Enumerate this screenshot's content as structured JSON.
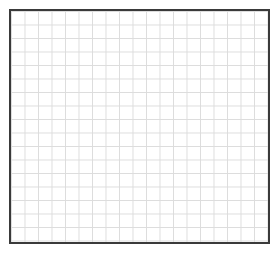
{
  "canvas": {
    "width": 280,
    "height": 254,
    "background_color": "#ffffff"
  },
  "grid_panel": {
    "name": "empty-grid-plot-area",
    "frame": {
      "left": 11,
      "top": 11,
      "width": 257,
      "height": 231,
      "border_color": "#3a3a3a",
      "border_width": 2,
      "fill_color": "#ffffff"
    },
    "gridlines": {
      "color": "#dcdcdc",
      "line_width": 1,
      "cell_width": 13.5,
      "cell_height": 13.5,
      "columns": 19,
      "rows": 17,
      "style": "uniform",
      "major_minor": false
    }
  },
  "chart_data": {
    "type": "scatter",
    "title": "",
    "subtitle": "",
    "xlabel": "",
    "ylabel": "",
    "categories": [],
    "series": [],
    "x": [],
    "values": [],
    "xtick_labels": [],
    "ytick_labels": [],
    "annotations": [],
    "legend": [],
    "legend_position": "none",
    "grid": true,
    "grid_columns": 19,
    "grid_rows": 17,
    "xlim": [
      0,
      19
    ],
    "ylim": [
      0,
      17
    ],
    "note": "Empty graph-paper style grid; no plotted data, axes labels, ticks, or legend are rendered."
  }
}
